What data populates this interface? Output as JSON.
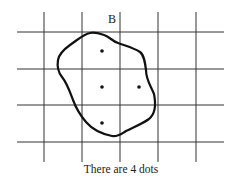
{
  "diagram": {
    "title_label": "B",
    "caption": "There are 4 dots",
    "grid": {
      "vertical_x": [
        44,
        82,
        120,
        158,
        196
      ],
      "horizontal_y": [
        32,
        69,
        105,
        142
      ],
      "x_range": [
        17,
        224
      ],
      "y_range": [
        12,
        162
      ],
      "color": "#333333"
    },
    "blob_path": "M90,33 C84,34 80,38 70,45 C63,50 59,54 58,60 C57,66 58,72 62,77 C67,83 70,92 73,100 C76,108 80,115 86,122 C92,129 102,134 112,136 C118,137 121,134 126,131 C134,127 142,124 149,119 C155,114 156,104 154,94 C151,86 146,80 146,70 C145,62 144,55 140,52 C134,48 126,46 118,43 C112,41 110,37 104,35 C98,33 94,32 90,33 Z",
    "dots": [
      {
        "x": 102,
        "y": 51
      },
      {
        "x": 102,
        "y": 87
      },
      {
        "x": 139,
        "y": 87
      },
      {
        "x": 102,
        "y": 123
      }
    ],
    "dot_count": 4
  }
}
